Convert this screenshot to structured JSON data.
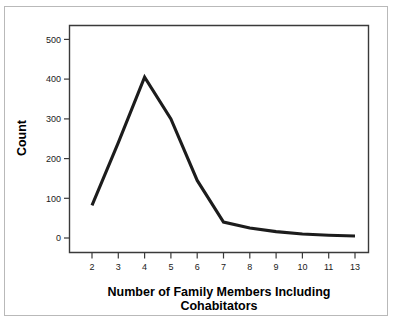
{
  "chart_data": {
    "type": "line",
    "title": "",
    "xlabel": "Number of Family Members Including Cohabitators",
    "xlabel_line1": "Number of Family Members Including",
    "xlabel_line2": "Cohabitators",
    "ylabel": "Count",
    "categories": [
      "2",
      "3",
      "4",
      "5",
      "6",
      "7",
      "8",
      "9",
      "10",
      "11",
      "13"
    ],
    "x": [
      2,
      3,
      4,
      5,
      6,
      7,
      8,
      9,
      10,
      11,
      13
    ],
    "values": [
      82,
      240,
      405,
      300,
      145,
      40,
      25,
      16,
      10,
      7,
      5
    ],
    "series": [
      {
        "name": "Count",
        "values": [
          82,
          240,
          405,
          300,
          145,
          40,
          25,
          16,
          10,
          7,
          5
        ]
      }
    ],
    "ylim": [
      0,
      530
    ],
    "yticks": [
      0,
      100,
      200,
      300,
      400,
      500
    ],
    "ytick_labels": [
      "0",
      "100",
      "200",
      "300",
      "400",
      "500"
    ],
    "xtick_labels": [
      "2",
      "3",
      "4",
      "5",
      "6",
      "7",
      "8",
      "9",
      "10",
      "11",
      "13"
    ],
    "grid": false,
    "legend": false,
    "legend_position": "none",
    "line_color": "#1c1c1c",
    "frame_color": "#3a3a3a",
    "border_color": "#b9b9b9",
    "background_color": "#ffffff"
  }
}
